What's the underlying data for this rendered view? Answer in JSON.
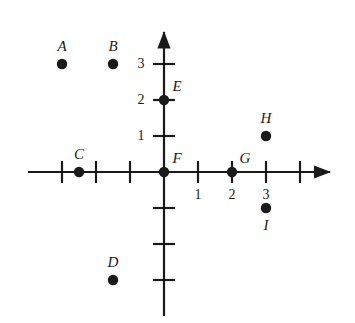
{
  "figure": {
    "kind": "coordinate-plane-with-labeled-points",
    "background_color": "#ffffff",
    "ink_color": "#1a1a1a"
  },
  "axes": {
    "x_axis_name": "x-axis",
    "y_axis_name": "y-axis",
    "x_range": [
      -4,
      5
    ],
    "y_range": [
      -4,
      4
    ],
    "x_tick_values": [
      -3,
      -2,
      -1,
      1,
      2,
      3,
      4
    ],
    "y_tick_values": [
      -3,
      -2,
      -1,
      1,
      2,
      3
    ],
    "x_tick_labels": [
      "1",
      "2",
      "3"
    ],
    "y_tick_labels": [
      "1",
      "2",
      "3"
    ],
    "labeled_x_ticks": [
      {
        "value": 1,
        "text": "1"
      },
      {
        "value": 2,
        "text": "2"
      },
      {
        "value": 3,
        "text": "3"
      }
    ],
    "labeled_y_ticks": [
      {
        "value": 1,
        "text": "1"
      },
      {
        "value": 2,
        "text": "2"
      },
      {
        "value": 3,
        "text": "3"
      }
    ],
    "arrowheads": [
      "x-positive",
      "y-positive"
    ],
    "grid": false
  },
  "points": [
    {
      "id": "A",
      "label": "A",
      "x": -3.0,
      "y": 3.0,
      "label_position": "above"
    },
    {
      "id": "B",
      "label": "B",
      "x": -1.5,
      "y": 3.0,
      "label_position": "above"
    },
    {
      "id": "C",
      "label": "C",
      "x": -2.5,
      "y": 0.0,
      "label_position": "above"
    },
    {
      "id": "D",
      "label": "D",
      "x": -1.5,
      "y": -3.0,
      "label_position": "above"
    },
    {
      "id": "E",
      "label": "E",
      "x": 0.0,
      "y": 2.0,
      "label_position": "upper-right"
    },
    {
      "id": "F",
      "label": "F",
      "x": 0.0,
      "y": 0.0,
      "label_position": "upper-right"
    },
    {
      "id": "G",
      "label": "G",
      "x": 2.0,
      "y": 0.0,
      "label_position": "upper-right"
    },
    {
      "id": "H",
      "label": "H",
      "x": 3.0,
      "y": 1.0,
      "label_position": "above"
    },
    {
      "id": "I",
      "label": "I",
      "x": 3.0,
      "y": -1.0,
      "label_position": "below"
    }
  ]
}
